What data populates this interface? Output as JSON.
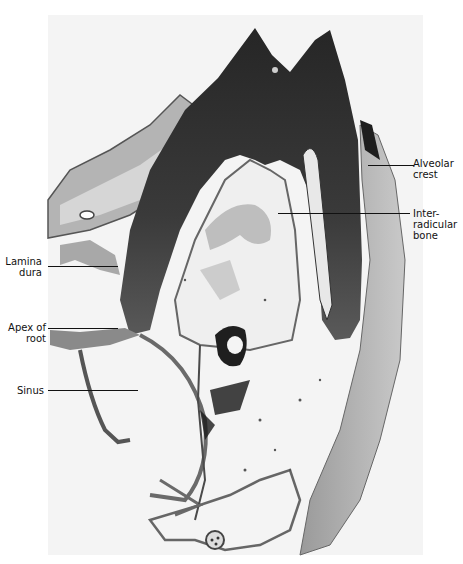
{
  "figure": {
    "type": "histology-photomicrograph",
    "background_color": "#ffffff",
    "tissue_colors": {
      "tooth_dark": "#2e2e2e",
      "tooth_mid": "#4a4a4a",
      "bone": "#8a8a8a",
      "soft_tissue": "#c8c8c8",
      "marrow_space": "#f3f3f3"
    },
    "labels": [
      {
        "id": "alveolar-crest",
        "text": "Alveolar\ncrest",
        "side": "right"
      },
      {
        "id": "inter-radicular-bone",
        "text": "Inter-\nradicular\nbone",
        "side": "right"
      },
      {
        "id": "lamina-dura",
        "text": "Lamina\ndura",
        "side": "left"
      },
      {
        "id": "apex-of-root",
        "text": "Apex of\nroot",
        "side": "left"
      },
      {
        "id": "sinus",
        "text": "Sinus",
        "side": "left"
      }
    ]
  }
}
